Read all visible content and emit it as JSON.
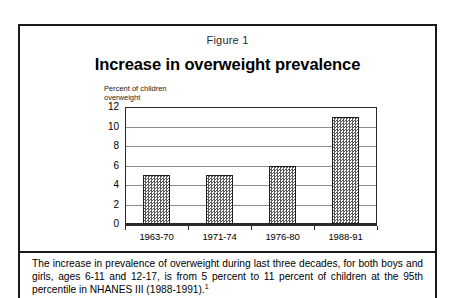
{
  "figure": {
    "label": "Figure 1",
    "title": "Increase in overweight prevalence",
    "caption_text": "The increase in prevalence of overweight during last three decades, for both boys and girls, ages 6-11 and 12-17, is from 5 percent to 11 percent of children at the 95th percentile in NHANES III (1988-1991).",
    "caption_footnote_marker": "1"
  },
  "chart_data": {
    "type": "bar",
    "title": "Increase in overweight prevalence",
    "categories": [
      "1963-70",
      "1971-74",
      "1976-80",
      "1988-91"
    ],
    "values": [
      5,
      5,
      6,
      11
    ],
    "xlabel": "",
    "ylabel": "Percent of children\noverweight",
    "ylim": [
      0,
      12
    ],
    "yticks": [
      0,
      2,
      4,
      6,
      8,
      10,
      12
    ],
    "grid": true,
    "legend": "none",
    "series_fill": "checkerboard-gray",
    "colors": {
      "bar_fill": "#5a5a5a",
      "bar_border": "#1d1d1d",
      "gridline": "#8d8d8d",
      "frame": "#2a2a2a",
      "text": "#000000"
    }
  }
}
